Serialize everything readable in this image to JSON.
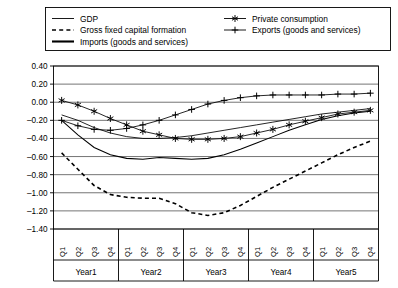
{
  "legend": {
    "position": "top",
    "entries": [
      {
        "label": "GDP",
        "marker": "plain-line-icon"
      },
      {
        "label": "Gross fixed capital formation",
        "marker": "dashed-line-icon"
      },
      {
        "label": "Imports (goods and services)",
        "marker": "thick-line-icon"
      },
      {
        "label": "Private consumption",
        "marker": "asterisk-marker-icon"
      },
      {
        "label": "Exports (goods and services)",
        "marker": "plus-marker-icon"
      }
    ]
  },
  "axes": {
    "y_ticks": [
      "0.40",
      "0.20",
      "0.00",
      "-0.20",
      "-0.40",
      "-0.60",
      "-0.80",
      "-1.00",
      "-1.20",
      "-1.40"
    ],
    "quarter_labels": [
      "Q1",
      "Q2",
      "Q3",
      "Q4"
    ],
    "year_labels": [
      "Year1",
      "Year2",
      "Year3",
      "Year4",
      "Year5"
    ]
  },
  "chart_data": {
    "type": "line",
    "title": "",
    "xlabel": "",
    "ylabel": "",
    "ylim": [
      -1.4,
      0.4
    ],
    "ytick_step": 0.2,
    "grid": true,
    "legend_position": "top",
    "categories": [
      "Year1 Q1",
      "Year1 Q2",
      "Year1 Q3",
      "Year1 Q4",
      "Year2 Q1",
      "Year2 Q2",
      "Year2 Q3",
      "Year2 Q4",
      "Year3 Q1",
      "Year3 Q2",
      "Year3 Q3",
      "Year3 Q4",
      "Year4 Q1",
      "Year4 Q2",
      "Year4 Q3",
      "Year4 Q4",
      "Year5 Q1",
      "Year5 Q2",
      "Year5 Q3",
      "Year5 Q4"
    ],
    "series": [
      {
        "name": "GDP",
        "style": "solid-thin",
        "marker": "none",
        "values": [
          -0.14,
          -0.2,
          -0.28,
          -0.34,
          -0.38,
          -0.4,
          -0.4,
          -0.39,
          -0.37,
          -0.34,
          -0.31,
          -0.28,
          -0.25,
          -0.22,
          -0.19,
          -0.16,
          -0.13,
          -0.11,
          -0.09,
          -0.07
        ]
      },
      {
        "name": "Gross fixed capital formation",
        "style": "dashed",
        "marker": "none",
        "values": [
          -0.56,
          -0.74,
          -0.92,
          -1.02,
          -1.05,
          -1.06,
          -1.06,
          -1.12,
          -1.22,
          -1.25,
          -1.22,
          -1.14,
          -1.04,
          -0.94,
          -0.85,
          -0.76,
          -0.67,
          -0.58,
          -0.5,
          -0.43
        ]
      },
      {
        "name": "Imports (goods and services)",
        "style": "solid-thick",
        "marker": "none",
        "values": [
          -0.2,
          -0.36,
          -0.5,
          -0.58,
          -0.62,
          -0.63,
          -0.61,
          -0.62,
          -0.63,
          -0.62,
          -0.58,
          -0.52,
          -0.45,
          -0.38,
          -0.31,
          -0.25,
          -0.19,
          -0.15,
          -0.12,
          -0.1
        ]
      },
      {
        "name": "Private consumption",
        "style": "solid-thin",
        "marker": "asterisk",
        "values": [
          0.02,
          -0.03,
          -0.1,
          -0.18,
          -0.25,
          -0.32,
          -0.36,
          -0.4,
          -0.41,
          -0.41,
          -0.4,
          -0.38,
          -0.34,
          -0.3,
          -0.25,
          -0.21,
          -0.17,
          -0.13,
          -0.11,
          -0.09
        ]
      },
      {
        "name": "Exports (goods and services)",
        "style": "solid-thin",
        "marker": "plus",
        "values": [
          -0.2,
          -0.26,
          -0.3,
          -0.31,
          -0.29,
          -0.25,
          -0.2,
          -0.14,
          -0.08,
          -0.02,
          0.02,
          0.05,
          0.07,
          0.08,
          0.08,
          0.08,
          0.08,
          0.09,
          0.09,
          0.1
        ]
      }
    ]
  }
}
